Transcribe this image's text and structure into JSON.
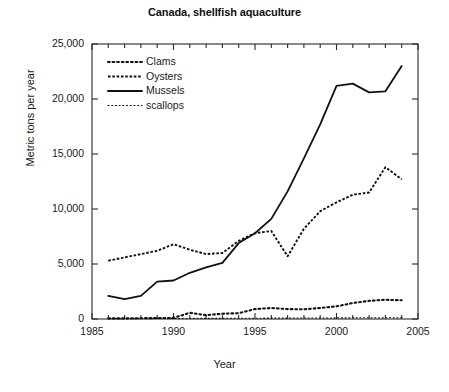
{
  "chart_data": {
    "type": "line",
    "title": "Canada, shellfish aquaculture",
    "xlabel": "Year",
    "ylabel": "Metric tons per year",
    "xlim": [
      1985,
      2005
    ],
    "ylim": [
      0,
      25000
    ],
    "xticks": [
      1985,
      1990,
      1995,
      2000,
      2005
    ],
    "xtick_labels": [
      "1985",
      "1990",
      "1995",
      "2000",
      "2005"
    ],
    "yticks": [
      0,
      5000,
      10000,
      15000,
      20000,
      25000
    ],
    "ytick_labels": [
      "0",
      "5,000",
      "10,000",
      "15,000",
      "20,000",
      "25,000"
    ],
    "minor_xticks": true,
    "grid": false,
    "legend_position": "upper left",
    "x": [
      1986,
      1987,
      1988,
      1989,
      1990,
      1991,
      1992,
      1993,
      1994,
      1995,
      1996,
      1997,
      1998,
      1999,
      2000,
      2001,
      2002,
      2003,
      2004
    ],
    "series": [
      {
        "name": "Clams",
        "linestyle": "dotted-large",
        "color": "#111111",
        "values": [
          60,
          60,
          70,
          90,
          100,
          560,
          350,
          480,
          530,
          900,
          1000,
          900,
          880,
          1000,
          1150,
          1450,
          1650,
          1750,
          1700
        ]
      },
      {
        "name": "Oysters",
        "linestyle": "dashed-dense",
        "color": "#111111",
        "values": [
          5300,
          5600,
          5900,
          6200,
          6800,
          6300,
          5900,
          6000,
          7100,
          7800,
          8000,
          5700,
          8200,
          9800,
          10600,
          11300,
          11500,
          13800,
          12700
        ]
      },
      {
        "name": "Mussels",
        "linestyle": "solid",
        "color": "#111111",
        "values": [
          2100,
          1800,
          2100,
          3400,
          3500,
          4200,
          4700,
          5100,
          6900,
          7800,
          9100,
          11600,
          14600,
          17700,
          21200,
          21400,
          20600,
          20700,
          23000
        ]
      },
      {
        "name": "scallops",
        "linestyle": "dotted-fine",
        "color": "#111111",
        "values": [
          30,
          30,
          40,
          40,
          50,
          50,
          60,
          60,
          70,
          70,
          80,
          80,
          90,
          90,
          100,
          110,
          110,
          120,
          120
        ]
      }
    ]
  },
  "legend": {
    "items": [
      {
        "label": "Clams"
      },
      {
        "label": "Oysters"
      },
      {
        "label": "Mussels"
      },
      {
        "label": "scallops"
      }
    ]
  }
}
